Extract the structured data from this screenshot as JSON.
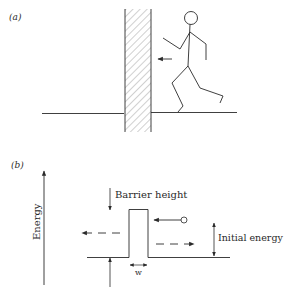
{
  "panels": [
    {
      "id": "a",
      "label": "(a)",
      "elements": {
        "wall": "hatched-wall",
        "figure": "stick-figure-running",
        "motion_arrow": "arrow-left"
      }
    },
    {
      "id": "b",
      "label": "(b)",
      "axis_label": "Energy",
      "barrier_height_label": "Barrier height",
      "initial_energy_label": "Initial energy",
      "width_label": "w",
      "elements": {
        "particle": "circle",
        "reflected": "dashed-arrow-right",
        "transmitted": "dashed-arrow-left"
      }
    }
  ],
  "colors": {
    "stroke": "#2a2a2a",
    "background": "#ffffff"
  }
}
